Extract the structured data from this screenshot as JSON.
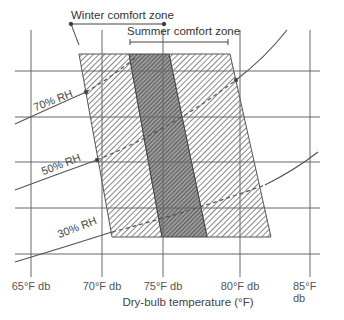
{
  "diagram": {
    "type": "psychrometric comfort zones",
    "zones": [
      {
        "name": "winter",
        "label": "Winter comfort zone"
      },
      {
        "name": "summer",
        "label": "Summer comfort zone"
      }
    ],
    "rh_curves": [
      {
        "label": "70% RH"
      },
      {
        "label": "50% RH"
      },
      {
        "label": "30% RH"
      }
    ],
    "x_axis": {
      "title": "Dry-bulb temperature (°F)",
      "ticks": [
        "65°F db",
        "70°F db",
        "75°F db",
        "80°F db",
        "85°F db"
      ]
    },
    "colors": {
      "line": "#555555",
      "hatch": "#6a6a6a",
      "overlap": "#4a4a4a"
    }
  }
}
